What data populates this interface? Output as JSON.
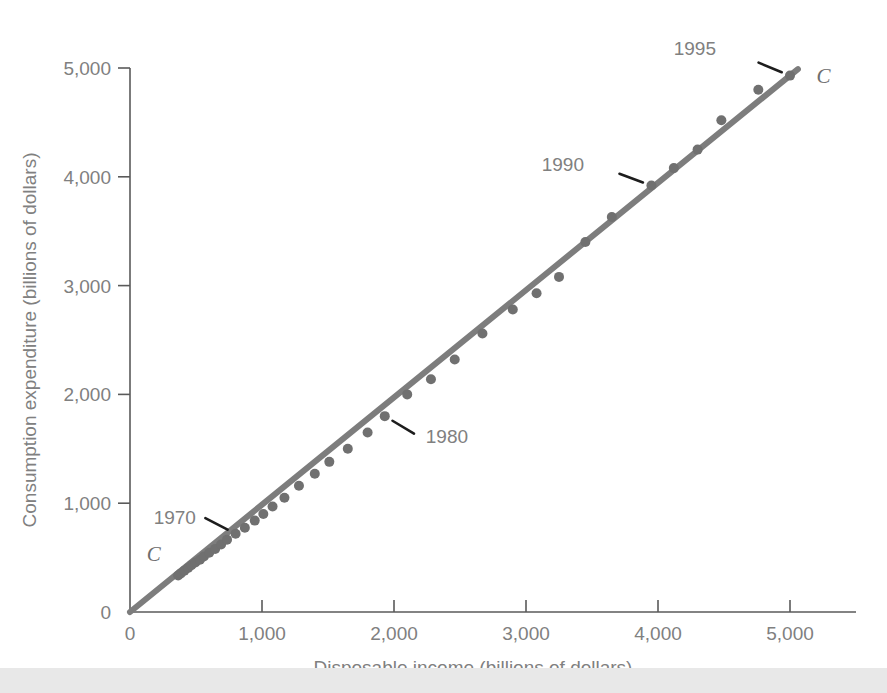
{
  "chart_data": {
    "type": "scatter",
    "title": "",
    "xlabel": "Disposable income (billions of dollars)",
    "ylabel": "Consumption expenditure (billions of dollars)",
    "xlim": [
      0,
      5500
    ],
    "ylim": [
      0,
      5400
    ],
    "xticks": [
      0,
      1000,
      2000,
      3000,
      4000,
      5000
    ],
    "yticks": [
      0,
      1000,
      2000,
      3000,
      4000,
      5000
    ],
    "xticklabels": [
      "0",
      "1,000",
      "2,000",
      "3,000",
      "4,000",
      "5,000"
    ],
    "yticklabels": [
      "0",
      "1,000",
      "2,000",
      "3,000",
      "4,000",
      "5,000"
    ],
    "grid": false,
    "legend": false,
    "series": [
      {
        "name": "C",
        "marker": "circle",
        "color": "#707070",
        "x": [
          365,
          385,
          412,
          440,
          465,
          495,
          530,
          560,
          600,
          645,
          690,
          735,
          800,
          870,
          945,
          1010,
          1080,
          1170,
          1280,
          1400,
          1510,
          1650,
          1800,
          1930,
          2100,
          2280,
          2460,
          2670,
          2900,
          3080,
          3250,
          3450,
          3650,
          3950,
          4120,
          4300,
          4480,
          4760,
          5000
        ],
        "y": [
          335,
          355,
          380,
          405,
          430,
          455,
          480,
          510,
          545,
          580,
          620,
          665,
          720,
          775,
          840,
          900,
          970,
          1050,
          1160,
          1270,
          1380,
          1500,
          1650,
          1800,
          2000,
          2140,
          2320,
          2560,
          2780,
          2930,
          3080,
          3400,
          3630,
          3920,
          4080,
          4250,
          4520,
          4800,
          4930
        ]
      }
    ],
    "fitline": {
      "name": "C",
      "color": "#7d7d7d",
      "from": [
        0,
        0
      ],
      "to": [
        5060,
        4990
      ]
    },
    "annotations": [
      {
        "label": "1970",
        "point_x": 800,
        "point_y": 720,
        "text_x": 560,
        "text_y": 870
      },
      {
        "label": "1980",
        "point_x": 1930,
        "point_y": 1800,
        "text_x": 2180,
        "text_y": 1620
      },
      {
        "label": "1990",
        "point_x": 3950,
        "point_y": 3920,
        "text_x": 3500,
        "text_y": 4120
      },
      {
        "label": "1995",
        "point_x": 5000,
        "point_y": 4930,
        "text_x": 4500,
        "text_y": 5180
      }
    ],
    "curve_labels": [
      {
        "text": "C",
        "x": 180,
        "y": 530,
        "position": "lower-left"
      },
      {
        "text": "C",
        "x": 5200,
        "y": 4930,
        "position": "upper-right"
      }
    ]
  }
}
